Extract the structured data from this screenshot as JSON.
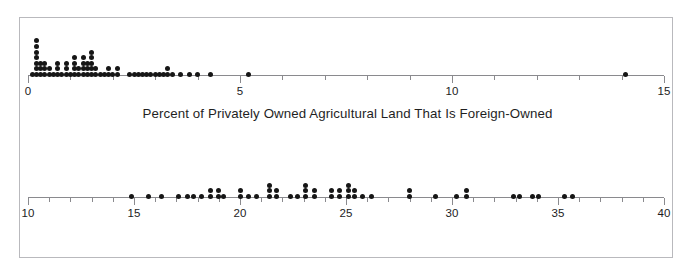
{
  "figure": {
    "background_color": "#ffffff",
    "frame_color": "#b9b9bd",
    "dot_color": "#161616",
    "axis_color": "#8a8a8e",
    "text_color": "#1f1f1f"
  },
  "panels": [
    {
      "id": "foreign-owned-land",
      "caption": "Percent of Privately Owned Agricultural Land That Is Foreign-Owned",
      "axis": {
        "min": 0,
        "max": 15,
        "major_ticks": [
          0,
          5,
          10,
          15
        ],
        "major_tick_labels": [
          "0",
          "5",
          "10",
          "15"
        ],
        "minor_tick_step": 1
      }
    },
    {
      "id": "adults-not-graduating",
      "caption": "Percent of Adults Not Graduating from High School",
      "axis": {
        "min": 10,
        "max": 40,
        "major_ticks": [
          10,
          15,
          20,
          25,
          30,
          35,
          40
        ],
        "major_tick_labels": [
          "10",
          "15",
          "20",
          "25",
          "30",
          "35",
          "40"
        ],
        "minor_tick_step": 1
      }
    }
  ],
  "chart_data": [
    {
      "type": "dotplot",
      "title": "",
      "xlabel": "Percent of Privately Owned Agricultural Land That Is Foreign-Owned",
      "ylabel": "",
      "xlim": [
        0,
        15
      ],
      "grid": false,
      "legend": "none",
      "xticks": [
        0,
        5,
        10,
        15
      ],
      "xticklabels": [
        "0",
        "5",
        "10",
        "15"
      ],
      "minor_tick_step": 1,
      "bin_width": 0.1,
      "stacks": [
        {
          "x": 0.1,
          "count": 1
        },
        {
          "x": 0.2,
          "count": 7
        },
        {
          "x": 0.3,
          "count": 3
        },
        {
          "x": 0.4,
          "count": 3
        },
        {
          "x": 0.5,
          "count": 2
        },
        {
          "x": 0.6,
          "count": 1
        },
        {
          "x": 0.7,
          "count": 3
        },
        {
          "x": 0.8,
          "count": 1
        },
        {
          "x": 0.9,
          "count": 3
        },
        {
          "x": 1.0,
          "count": 1
        },
        {
          "x": 1.1,
          "count": 4
        },
        {
          "x": 1.2,
          "count": 2
        },
        {
          "x": 1.3,
          "count": 4
        },
        {
          "x": 1.4,
          "count": 3
        },
        {
          "x": 1.5,
          "count": 5
        },
        {
          "x": 1.6,
          "count": 2
        },
        {
          "x": 1.7,
          "count": 1
        },
        {
          "x": 1.8,
          "count": 1
        },
        {
          "x": 1.9,
          "count": 2
        },
        {
          "x": 2.0,
          "count": 1
        },
        {
          "x": 2.1,
          "count": 2
        },
        {
          "x": 2.4,
          "count": 1
        },
        {
          "x": 2.5,
          "count": 1
        },
        {
          "x": 2.6,
          "count": 1
        },
        {
          "x": 2.7,
          "count": 1
        },
        {
          "x": 2.8,
          "count": 1
        },
        {
          "x": 2.9,
          "count": 1
        },
        {
          "x": 3.0,
          "count": 1
        },
        {
          "x": 3.1,
          "count": 1
        },
        {
          "x": 3.2,
          "count": 1
        },
        {
          "x": 3.3,
          "count": 2
        },
        {
          "x": 3.4,
          "count": 1
        },
        {
          "x": 3.6,
          "count": 1
        },
        {
          "x": 3.8,
          "count": 1
        },
        {
          "x": 4.0,
          "count": 1
        },
        {
          "x": 4.3,
          "count": 1
        },
        {
          "x": 5.2,
          "count": 1
        },
        {
          "x": 14.1,
          "count": 1
        }
      ]
    },
    {
      "type": "dotplot",
      "title": "",
      "xlabel": "Percent of Adults Not Graduating from High School",
      "ylabel": "",
      "xlim": [
        10,
        40
      ],
      "grid": false,
      "legend": "none",
      "xticks": [
        10,
        15,
        20,
        25,
        30,
        35,
        40
      ],
      "xticklabels": [
        "10",
        "15",
        "20",
        "25",
        "30",
        "35",
        "40"
      ],
      "minor_tick_step": 1,
      "bin_width": 0.4,
      "stacks": [
        {
          "x": 14.9,
          "count": 1
        },
        {
          "x": 15.7,
          "count": 1
        },
        {
          "x": 16.3,
          "count": 1
        },
        {
          "x": 17.1,
          "count": 1
        },
        {
          "x": 17.5,
          "count": 1
        },
        {
          "x": 17.8,
          "count": 1
        },
        {
          "x": 18.2,
          "count": 1
        },
        {
          "x": 18.6,
          "count": 2
        },
        {
          "x": 19.0,
          "count": 2
        },
        {
          "x": 19.2,
          "count": 1
        },
        {
          "x": 20.0,
          "count": 2
        },
        {
          "x": 20.4,
          "count": 1
        },
        {
          "x": 20.8,
          "count": 1
        },
        {
          "x": 21.4,
          "count": 3
        },
        {
          "x": 21.7,
          "count": 2
        },
        {
          "x": 22.4,
          "count": 1
        },
        {
          "x": 22.7,
          "count": 1
        },
        {
          "x": 23.1,
          "count": 3
        },
        {
          "x": 23.5,
          "count": 2
        },
        {
          "x": 24.3,
          "count": 2
        },
        {
          "x": 24.7,
          "count": 2
        },
        {
          "x": 25.1,
          "count": 3
        },
        {
          "x": 25.4,
          "count": 2
        },
        {
          "x": 25.8,
          "count": 1
        },
        {
          "x": 26.2,
          "count": 1
        },
        {
          "x": 28.0,
          "count": 2
        },
        {
          "x": 29.2,
          "count": 1
        },
        {
          "x": 30.2,
          "count": 1
        },
        {
          "x": 30.7,
          "count": 2
        },
        {
          "x": 32.9,
          "count": 1
        },
        {
          "x": 33.2,
          "count": 1
        },
        {
          "x": 33.8,
          "count": 1
        },
        {
          "x": 34.1,
          "count": 1
        },
        {
          "x": 35.3,
          "count": 1
        },
        {
          "x": 35.7,
          "count": 1
        }
      ]
    }
  ]
}
